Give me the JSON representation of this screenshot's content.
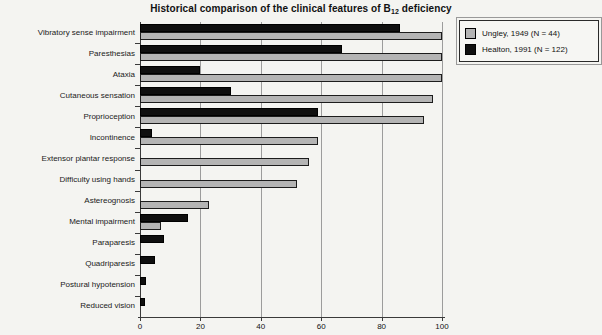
{
  "title": {
    "prefix": "Historical comparison of the clinical features of B",
    "subscript": "12",
    "suffix": " deficiency"
  },
  "legend": {
    "items": [
      {
        "label": "Ungley, 1949 (N = 44)",
        "swatch": "gray"
      },
      {
        "label": "Healton, 1991 (N = 122)",
        "swatch": "black"
      }
    ]
  },
  "colors": {
    "ungley_bar": "#b4b4b4",
    "healton_bar": "#0f0f0f",
    "background": "#f4f4f1",
    "gridline": "#9c9c9c",
    "axis": "#3a3a3a"
  },
  "chart_data": {
    "type": "bar",
    "orientation": "horizontal",
    "title": "Historical comparison of the clinical features of B12 deficiency",
    "categories": [
      "Vibratory sense impairment",
      "Paresthesias",
      "Ataxia",
      "Cutaneous sensation",
      "Proprioception",
      "Incontinence",
      "Extensor plantar response",
      "Difficulty using hands",
      "Astereognosis",
      "Mental impairment",
      "Paraparesis",
      "Quadriparesis",
      "Postural hypotension",
      "Reduced vision"
    ],
    "series": [
      {
        "name": "Ungley, 1949 (N = 44)",
        "color": "#b4b4b4",
        "values": [
          100,
          100,
          100,
          97,
          94,
          59,
          56,
          52,
          23,
          7,
          0,
          0,
          0,
          0
        ]
      },
      {
        "name": "Healton, 1991 (N = 122)",
        "color": "#0f0f0f",
        "values": [
          86,
          67,
          20,
          30,
          59,
          4,
          0,
          0,
          0,
          16,
          8,
          5,
          2,
          1.5
        ]
      }
    ],
    "xlabel": "",
    "ylabel": "",
    "xlim": [
      0,
      100
    ],
    "xticks": [
      0,
      20,
      40,
      60,
      80,
      100
    ],
    "grid": "vertical",
    "legend_position": "top-right"
  }
}
